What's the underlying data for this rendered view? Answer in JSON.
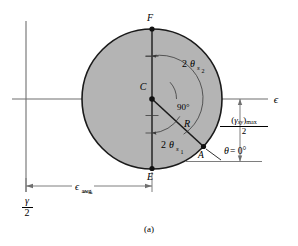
{
  "figure": {
    "caption": "(a)",
    "type": "mohrs-circle-strain",
    "axes": {
      "horizontal_label": "ϵ",
      "vertical_label_numerator": "γ",
      "vertical_label_denominator": "2"
    },
    "points": [
      {
        "id": "F",
        "label": "F",
        "x": 152,
        "y": 29,
        "desc": "top-of-circle"
      },
      {
        "id": "C",
        "label": "C",
        "x": 152,
        "y": 99,
        "desc": "center"
      },
      {
        "id": "E",
        "label": "E",
        "x": 152,
        "y": 168,
        "desc": "bottom-of-circle"
      },
      {
        "id": "A",
        "label": "A",
        "x": 203,
        "y": 146,
        "desc": "state-point-theta-zero"
      }
    ],
    "annotations": {
      "angle_s2": {
        "prefix": "2 ",
        "symbol": "θ",
        "sub": "s",
        "sub2": "2"
      },
      "angle_s1": {
        "prefix": "2 ",
        "symbol": "θ",
        "sub": "s",
        "sub2": "1"
      },
      "right_angle": "90°",
      "radius": "R",
      "theta_zero": {
        "symbol": "θ",
        "equals": " = 0°"
      },
      "eps_avg": {
        "symbol": "ϵ",
        "sub": "avg"
      },
      "gamma_max": {
        "numerator_open": "(",
        "numerator_symbol": "γ",
        "numerator_sub": "xy",
        "numerator_close": ")",
        "numerator_max": "max",
        "denominator": "2"
      }
    },
    "geometry": {
      "center_x": 152,
      "center_y": 99,
      "radius": 70,
      "fill_color": "#b3b3b3",
      "stroke_color": "#1a1a1a",
      "axis_color": "#6b6b6b",
      "vertical_axis_x": 26
    }
  }
}
